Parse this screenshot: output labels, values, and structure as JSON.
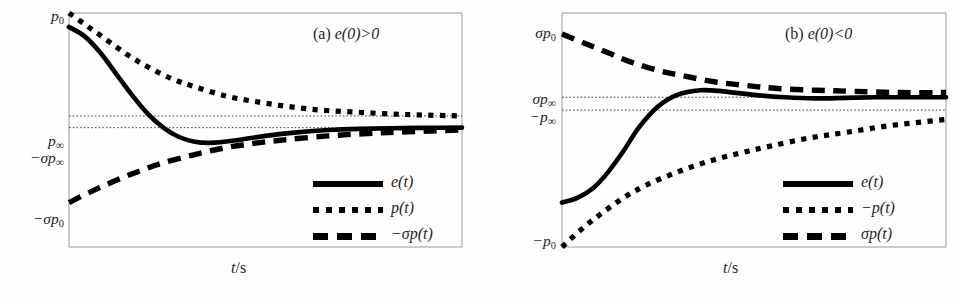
{
  "figure": {
    "caption_a": "(a) e(0)>0",
    "caption_b": "(b) e(0)<0",
    "xaxis_label": "t/s"
  },
  "chart_data": [
    {
      "type": "line",
      "id": "panel-a",
      "title": "(a) e(0)>0",
      "xlabel": "t/s",
      "ylabel": "",
      "grid": false,
      "legend_position": "lower-right",
      "xlim": [
        0,
        1
      ],
      "ylim": [
        -1,
        1
      ],
      "ytick_labels": [
        "p_0",
        "p_inf",
        "-sigma*p_inf",
        "-sigma*p_0"
      ],
      "ytick_display": [
        "p₀",
        "p∞",
        "−σp∞",
        "−σp₀"
      ],
      "ytick_values": [
        1.0,
        0.12,
        0.02,
        -0.62
      ],
      "guide_lines": [
        {
          "label": "p∞",
          "value": 0.12
        },
        {
          "label": "−σp∞",
          "value": 0.02
        }
      ],
      "series": [
        {
          "name": "e(t)",
          "style": "solid",
          "description": "starts near p0, decays with undershoot below -sigma*p_inf, recovers to -sigma*p_inf",
          "x": [
            0.0,
            0.04,
            0.08,
            0.12,
            0.16,
            0.2,
            0.24,
            0.28,
            0.32,
            0.36,
            0.42,
            0.5,
            0.58,
            0.66,
            0.74,
            0.82,
            0.9,
            1.0
          ],
          "y": [
            0.88,
            0.8,
            0.66,
            0.48,
            0.3,
            0.14,
            0.02,
            -0.06,
            -0.1,
            -0.11,
            -0.09,
            -0.05,
            -0.02,
            0.0,
            0.01,
            0.015,
            0.018,
            0.02
          ]
        },
        {
          "name": "p(t)",
          "style": "dotted",
          "description": "monotone decay from p0 to p_inf",
          "x": [
            0.0,
            0.05,
            0.1,
            0.15,
            0.2,
            0.26,
            0.32,
            0.4,
            0.48,
            0.56,
            0.64,
            0.72,
            0.8,
            0.88,
            1.0
          ],
          "y": [
            1.0,
            0.88,
            0.76,
            0.64,
            0.54,
            0.44,
            0.37,
            0.29,
            0.24,
            0.2,
            0.17,
            0.155,
            0.14,
            0.13,
            0.12
          ]
        },
        {
          "name": "−σp(t)",
          "style": "dashed",
          "description": "monotone rise from -sigma*p0 to -sigma*p_inf",
          "x": [
            0.0,
            0.06,
            0.12,
            0.18,
            0.24,
            0.32,
            0.4,
            0.48,
            0.56,
            0.66,
            0.76,
            0.86,
            1.0
          ],
          "y": [
            -0.62,
            -0.52,
            -0.43,
            -0.35,
            -0.28,
            -0.21,
            -0.15,
            -0.11,
            -0.08,
            -0.05,
            -0.03,
            -0.015,
            0.0
          ]
        }
      ],
      "legend": [
        {
          "label": "e(t)",
          "style": "solid"
        },
        {
          "label": "p(t)",
          "style": "dotted"
        },
        {
          "label": "−σp(t)",
          "style": "dashed"
        }
      ]
    },
    {
      "type": "line",
      "id": "panel-b",
      "title": "(b) e(0)<0",
      "xlabel": "t/s",
      "ylabel": "",
      "grid": false,
      "legend_position": "lower-right",
      "xlim": [
        0,
        1
      ],
      "ylim": [
        -1,
        1
      ],
      "ytick_labels": [
        "sigma*p_0",
        "sigma*p_inf",
        "-p_inf",
        "-p_0"
      ],
      "ytick_display": [
        "σp₀",
        "σp∞",
        "−p∞",
        "−p₀"
      ],
      "ytick_values": [
        0.82,
        0.28,
        0.17,
        -1.0
      ],
      "guide_lines": [
        {
          "label": "σp∞",
          "value": 0.28
        },
        {
          "label": "−p∞",
          "value": 0.17
        }
      ],
      "series": [
        {
          "name": "e(t)",
          "style": "solid",
          "description": "starts near -p0, rises with overshoot above sigma*p_inf, settles to sigma*p_inf",
          "x": [
            0.0,
            0.04,
            0.08,
            0.12,
            0.16,
            0.2,
            0.25,
            0.3,
            0.36,
            0.42,
            0.5,
            0.58,
            0.66,
            0.74,
            0.82,
            0.9,
            1.0
          ],
          "y": [
            -0.62,
            -0.58,
            -0.5,
            -0.36,
            -0.18,
            0.02,
            0.2,
            0.3,
            0.34,
            0.33,
            0.3,
            0.28,
            0.27,
            0.275,
            0.28,
            0.28,
            0.28
          ]
        },
        {
          "name": "−p(t)",
          "style": "dotted",
          "description": "monotone rise from -p0 to -p_inf",
          "x": [
            0.0,
            0.05,
            0.1,
            0.16,
            0.22,
            0.3,
            0.38,
            0.46,
            0.54,
            0.64,
            0.74,
            0.86,
            1.0
          ],
          "y": [
            -1.0,
            -0.85,
            -0.72,
            -0.58,
            -0.47,
            -0.36,
            -0.27,
            -0.2,
            -0.14,
            -0.07,
            -0.02,
            0.04,
            0.09
          ]
        },
        {
          "name": "σp(t)",
          "style": "dashed",
          "description": "monotone decay from sigma*p0 to sigma*p_inf",
          "x": [
            0.0,
            0.06,
            0.12,
            0.18,
            0.25,
            0.32,
            0.4,
            0.48,
            0.56,
            0.66,
            0.76,
            0.88,
            1.0
          ],
          "y": [
            0.82,
            0.74,
            0.66,
            0.58,
            0.51,
            0.46,
            0.41,
            0.38,
            0.355,
            0.34,
            0.33,
            0.32,
            0.32
          ]
        }
      ],
      "legend": [
        {
          "label": "e(t)",
          "style": "solid"
        },
        {
          "label": "−p(t)",
          "style": "dotted"
        },
        {
          "label": "σp(t)",
          "style": "dashed"
        }
      ]
    }
  ],
  "panel_a": {
    "title_roman": "(a) ",
    "title_math": "e(0)>0",
    "axis_labels": {
      "p0": "p",
      "p0_sub": "0",
      "pinf": "p",
      "pinf_sub": "∞",
      "nspinf_pre": "−σp",
      "nspinf_sub": "∞",
      "nsp0_pre": "−σp",
      "nsp0_sub": "0"
    },
    "legend": {
      "e": "e(t)",
      "p": "p(t)",
      "sp": "−σp(t)"
    },
    "xlabel_t": "t",
    "xlabel_rest": "/s"
  },
  "panel_b": {
    "title_roman": "(b) ",
    "title_math": "e(0)<0",
    "axis_labels": {
      "sp0_pre": "σp",
      "sp0_sub": "0",
      "spinf_pre": "σp",
      "spinf_sub": "∞",
      "npinf_pre": "−p",
      "npinf_sub": "∞",
      "np0_pre": "−p",
      "np0_sub": "0"
    },
    "legend": {
      "e": "e(t)",
      "p": "−p(t)",
      "sp": "σp(t)"
    },
    "xlabel_t": "t",
    "xlabel_rest": "/s"
  },
  "colors": {
    "ink": "#000000",
    "frame": "#9a9a9a",
    "background": "#ffffff"
  }
}
